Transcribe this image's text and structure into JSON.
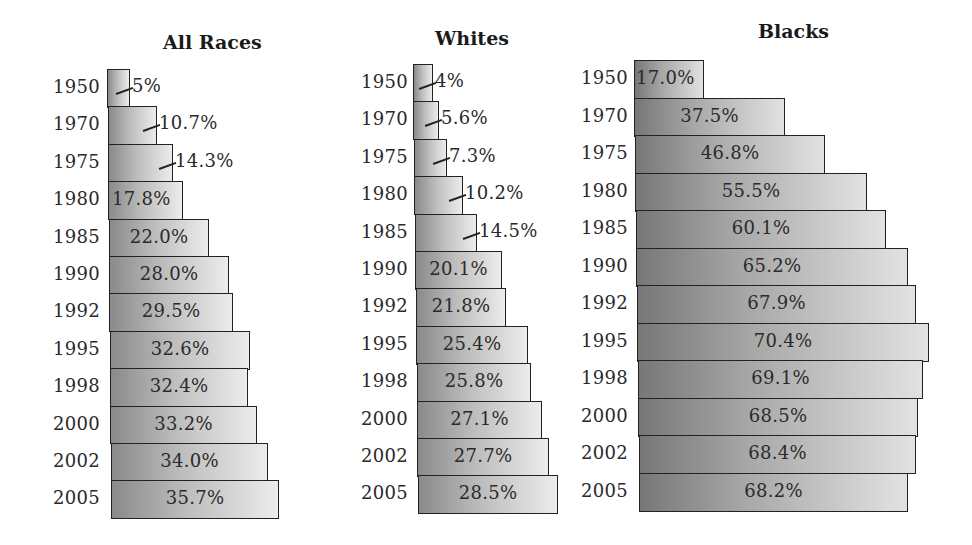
{
  "chart_data": [
    {
      "type": "bar",
      "orientation": "horizontal",
      "title": "All Races",
      "categories": [
        "1950",
        "1970",
        "1975",
        "1980",
        "1985",
        "1990",
        "1992",
        "1995",
        "1998",
        "2000",
        "2002",
        "2005"
      ],
      "values": [
        5,
        10.7,
        14.3,
        17.8,
        22.0,
        28.0,
        29.5,
        32.6,
        32.4,
        33.2,
        34.0,
        35.7
      ],
      "labels": [
        "5%",
        "10.7%",
        "14.3%",
        "17.8%",
        "22.0%",
        "28.0%",
        "29.5%",
        "32.6%",
        "32.4%",
        "33.2%",
        "34.0%",
        "35.7%"
      ],
      "xlabel": "",
      "ylabel": "",
      "grid": false
    },
    {
      "type": "bar",
      "orientation": "horizontal",
      "title": "Whites",
      "categories": [
        "1950",
        "1970",
        "1975",
        "1980",
        "1985",
        "1990",
        "1992",
        "1995",
        "1998",
        "2000",
        "2002",
        "2005"
      ],
      "values": [
        4,
        5.6,
        7.3,
        10.2,
        14.5,
        20.1,
        21.8,
        25.4,
        25.8,
        27.1,
        27.7,
        28.5
      ],
      "labels": [
        "4%",
        "5.6%",
        "7.3%",
        "10.2%",
        "14.5%",
        "20.1%",
        "21.8%",
        "25.4%",
        "25.8%",
        "27.1%",
        "27.7%",
        "28.5%"
      ],
      "xlabel": "",
      "ylabel": "",
      "grid": false
    },
    {
      "type": "bar",
      "orientation": "horizontal",
      "title": "Blacks",
      "categories": [
        "1950",
        "1970",
        "1975",
        "1980",
        "1985",
        "1990",
        "1992",
        "1995",
        "1998",
        "2000",
        "2002",
        "2005"
      ],
      "values": [
        17.0,
        37.5,
        46.8,
        55.5,
        60.1,
        65.2,
        67.9,
        70.4,
        69.1,
        68.5,
        68.4,
        68.2
      ],
      "labels": [
        "17.0%",
        "37.5%",
        "46.8%",
        "55.5%",
        "60.1%",
        "65.2%",
        "67.9%",
        "70.4%",
        "69.1%",
        "68.5%",
        "68.4%",
        "68.2%"
      ],
      "xlabel": "",
      "ylabel": "",
      "grid": false
    }
  ],
  "panels": {
    "all": {
      "title": "All Races",
      "rows": [
        {
          "year": "1950",
          "label": "5%"
        },
        {
          "year": "1970",
          "label": "10.7%"
        },
        {
          "year": "1975",
          "label": "14.3%"
        },
        {
          "year": "1980",
          "label": "17.8%"
        },
        {
          "year": "1985",
          "label": "22.0%"
        },
        {
          "year": "1990",
          "label": "28.0%"
        },
        {
          "year": "1992",
          "label": "29.5%"
        },
        {
          "year": "1995",
          "label": "32.6%"
        },
        {
          "year": "1998",
          "label": "32.4%"
        },
        {
          "year": "2000",
          "label": "33.2%"
        },
        {
          "year": "2002",
          "label": "34.0%"
        },
        {
          "year": "2005",
          "label": "35.7%"
        }
      ]
    },
    "whites": {
      "title": "Whites",
      "rows": [
        {
          "year": "1950",
          "label": "4%"
        },
        {
          "year": "1970",
          "label": "5.6%"
        },
        {
          "year": "1975",
          "label": "7.3%"
        },
        {
          "year": "1980",
          "label": "10.2%"
        },
        {
          "year": "1985",
          "label": "14.5%"
        },
        {
          "year": "1990",
          "label": "20.1%"
        },
        {
          "year": "1992",
          "label": "21.8%"
        },
        {
          "year": "1995",
          "label": "25.4%"
        },
        {
          "year": "1998",
          "label": "25.8%"
        },
        {
          "year": "2000",
          "label": "27.1%"
        },
        {
          "year": "2002",
          "label": "27.7%"
        },
        {
          "year": "2005",
          "label": "28.5%"
        }
      ]
    },
    "blacks": {
      "title": "Blacks",
      "rows": [
        {
          "year": "1950",
          "label": "17.0%"
        },
        {
          "year": "1970",
          "label": "37.5%"
        },
        {
          "year": "1975",
          "label": "46.8%"
        },
        {
          "year": "1980",
          "label": "55.5%"
        },
        {
          "year": "1985",
          "label": "60.1%"
        },
        {
          "year": "1990",
          "label": "65.2%"
        },
        {
          "year": "1992",
          "label": "67.9%"
        },
        {
          "year": "1995",
          "label": "70.4%"
        },
        {
          "year": "1998",
          "label": "69.1%"
        },
        {
          "year": "2000",
          "label": "68.5%"
        },
        {
          "year": "2002",
          "label": "68.4%"
        },
        {
          "year": "2005",
          "label": "68.2%"
        }
      ]
    }
  }
}
